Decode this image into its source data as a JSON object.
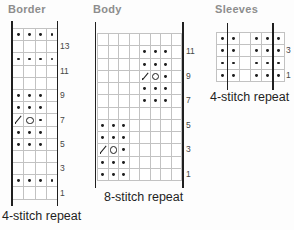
{
  "theme": {
    "ink": "#1f1f1f",
    "grid_line": "#c2c2c2",
    "title_color": "#8d8d8d"
  },
  "legend": {
    "k": "purl-dot-symbol",
    "O": "yarnover-symbol",
    "/": "decrease-symbol",
    ".": "empty-knit-cell"
  },
  "charts": [
    {
      "id": "border",
      "title": "Border",
      "caption": "4-stitch repeat",
      "cols": 4,
      "rows": [
        "kkkk",
        "....",
        "kkkk",
        "....",
        "....",
        "kkk.",
        "kkk.",
        "/Ok.",
        "kkk.",
        "kkk.",
        "....",
        "....",
        "kkkk",
        "...."
      ],
      "labels": [
        {
          "text": "13",
          "r": 1
        },
        {
          "text": "11",
          "r": 3
        },
        {
          "text": "9",
          "r": 5
        },
        {
          "text": "7",
          "r": 7
        },
        {
          "text": "5",
          "r": 9
        },
        {
          "text": "3",
          "r": 11
        },
        {
          "text": "1",
          "r": 13
        }
      ]
    },
    {
      "id": "body",
      "title": "Body",
      "caption": "8-stitch repeat",
      "cols": 8,
      "rows": [
        "........",
        "....kkk.",
        "....kkk.",
        "..../Ok.",
        "....kkk.",
        "....kkk.",
        "........",
        "kkk.....",
        "kkk.....",
        "/Ok.....",
        "kkk.....",
        "kkk....."
      ],
      "labels": [
        {
          "text": "11",
          "r": 1
        },
        {
          "text": "9",
          "r": 3
        },
        {
          "text": "7",
          "r": 5
        },
        {
          "text": "5",
          "r": 7
        },
        {
          "text": "3",
          "r": 9
        },
        {
          "text": "1",
          "r": 11
        }
      ]
    },
    {
      "id": "sleeves",
      "title": "Sleeves",
      "caption": "4-stitch repeat",
      "cols": 6,
      "rows": [
        "kk.kkk",
        "kk.kkk",
        "kk.kkk",
        "kk.kkk"
      ],
      "labels": [
        {
          "text": "3",
          "r": 1
        },
        {
          "text": "1",
          "r": 3
        }
      ]
    }
  ]
}
